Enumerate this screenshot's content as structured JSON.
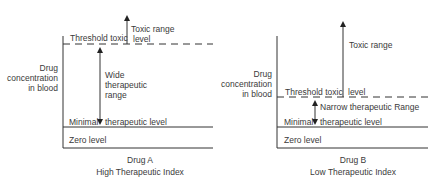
{
  "diagram_a": {
    "axis_label": [
      "Drug",
      "concentration",
      "in blood"
    ],
    "threshold_label": "Threshold toxic",
    "threshold_label_2": "level",
    "toxic_range_label": "Toxic range",
    "range_label": [
      "Wide",
      "therapeutic",
      "range"
    ],
    "minimal_label_1": "Minimal",
    "minimal_label_2": "therapeutic level",
    "zero_label": "Zero level",
    "drug_name": "Drug A",
    "index_label": "High Therapeutic Index"
  },
  "diagram_b": {
    "axis_label": [
      "Drug",
      "concentration",
      "in blood"
    ],
    "toxic_range_label": "Toxic range",
    "threshold_label": "Threshold toxic",
    "threshold_label_2": "level",
    "range_label": "Narrow therapeutic Range",
    "minimal_label_1": "Minimal",
    "minimal_label_2": "therapeutic level",
    "zero_label": "Zero level",
    "drug_name": "Drug B",
    "index_label": "Low Therapeutic Index"
  },
  "colors": {
    "line": "#333333",
    "text": "#3a3a3a"
  }
}
